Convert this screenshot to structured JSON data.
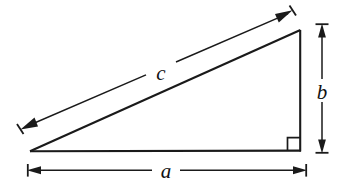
{
  "figure": {
    "background_color": "#ffffff",
    "ink_color": "#1a1a1a",
    "labels": {
      "hypotenuse": "c",
      "vertical_leg": "b",
      "horizontal_leg": "a"
    },
    "geometry": {
      "left_vertex": [
        30,
        151
      ],
      "right_vertex": [
        300,
        151
      ],
      "top_vertex": [
        300,
        30
      ],
      "right_angle_marker": true,
      "right_angle_marker_size": 13
    },
    "dimensions": [
      {
        "name": "hypotenuse-dimension",
        "label": "c",
        "orientation": "diagonal",
        "arrow_start": [
          22,
          128
        ],
        "arrow_end": [
          291,
          12
        ],
        "label_position": [
          161,
          73
        ],
        "double_headed": true,
        "serif_caps": true
      },
      {
        "name": "vertical-leg-dimension",
        "label": "b",
        "orientation": "vertical",
        "arrow_start": [
          322,
          25
        ],
        "arrow_end": [
          322,
          152
        ],
        "label_position": [
          322,
          95
        ],
        "double_headed": true,
        "serif_caps": true
      },
      {
        "name": "horizontal-leg-dimension",
        "label": "a",
        "orientation": "horizontal",
        "arrow_start": [
          29,
          170
        ],
        "arrow_end": [
          305,
          170
        ],
        "label_position": [
          166,
          177
        ],
        "double_headed": true,
        "serif_caps": true
      }
    ]
  }
}
